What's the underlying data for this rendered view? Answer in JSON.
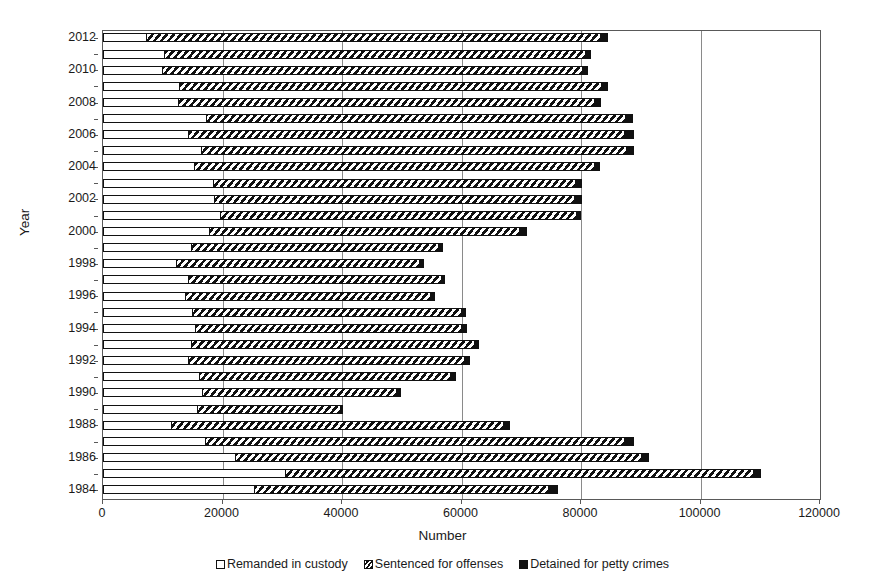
{
  "chart_data": {
    "type": "bar",
    "orientation": "horizontal",
    "stacked": true,
    "title": "",
    "xlabel": "Number",
    "ylabel": "Year",
    "xlim": [
      0,
      120000
    ],
    "xticks": [
      0,
      20000,
      40000,
      60000,
      80000,
      100000,
      120000
    ],
    "xtick_labels": [
      "0",
      "20000",
      "40000",
      "60000",
      "80000",
      "100000",
      "120000"
    ],
    "grid": "vertical",
    "legend_position": "bottom",
    "categories": [
      "2012",
      "2011",
      "2010",
      "2009",
      "2008",
      "2007",
      "2006",
      "2005",
      "2004",
      "2003",
      "2002",
      "2001",
      "2000",
      "1999",
      "1998",
      "1997",
      "1996",
      "1995",
      "1994",
      "1993",
      "1992",
      "1991",
      "1990",
      "1989",
      "1988",
      "1987",
      "1986",
      "1985",
      "1984"
    ],
    "ytick_labels": [
      "2012",
      "2010",
      "2008",
      "2006",
      "2004",
      "2002",
      "2000",
      "1998",
      "1996",
      "1994",
      "1992",
      "1990",
      "1988",
      "1986",
      "1984"
    ],
    "series": [
      {
        "name": "Remanded in custody",
        "pattern": "solid-white",
        "values": [
          7200,
          10200,
          9800,
          12800,
          12600,
          17200,
          14200,
          16400,
          15300,
          18400,
          18600,
          19500,
          17800,
          14800,
          12200,
          14300,
          13700,
          14900,
          15400,
          14800,
          14300,
          16100,
          16500,
          15800,
          11400,
          17100,
          22100,
          30500,
          25300
        ]
      },
      {
        "name": "Sentenced for offenses",
        "pattern": "diagonal-hatch",
        "values": [
          76000,
          70500,
          70400,
          70600,
          69500,
          70100,
          73000,
          71200,
          66800,
          60600,
          60300,
          59600,
          51800,
          41200,
          40700,
          42200,
          41100,
          45000,
          44500,
          47300,
          46200,
          42000,
          32500,
          23800,
          55500,
          70100,
          68000,
          78300,
          49200
        ]
      },
      {
        "name": "Detained for petty crimes",
        "pattern": "solid-black",
        "values": [
          1300,
          1000,
          1000,
          1100,
          1200,
          1400,
          1600,
          1300,
          1100,
          1100,
          1200,
          900,
          1300,
          900,
          800,
          700,
          800,
          800,
          1100,
          900,
          1000,
          900,
          900,
          500,
          1200,
          1600,
          1300,
          1400,
          1600
        ]
      }
    ],
    "totals": [
      84500,
      81700,
      81200,
      84500,
      83300,
      88700,
      88800,
      88900,
      83200,
      80100,
      80100,
      80000,
      70900,
      56900,
      53700,
      57200,
      55600,
      60700,
      61000,
      63000,
      61500,
      59000,
      49900,
      40100,
      68100,
      88800,
      91400,
      110200,
      76100
    ]
  },
  "legend": {
    "items": [
      {
        "label": "Remanded in custody",
        "swatch": "white-square-icon"
      },
      {
        "label": "Sentenced for offenses",
        "swatch": "hatched-square-icon"
      },
      {
        "label": "Detained for petty crimes",
        "swatch": "black-square-icon"
      }
    ]
  }
}
